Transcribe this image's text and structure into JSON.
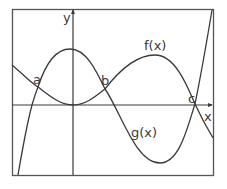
{
  "diagram": {
    "type": "function-graph",
    "axes": {
      "x_label": "x",
      "y_label": "y"
    },
    "curves": [
      {
        "name": "f",
        "label": "f(x)",
        "description": "cubic-like curve with local max near y-axis, local min, and second local max before rising sharply"
      },
      {
        "name": "g",
        "label": "g(x)",
        "description": "curve with minimum at origin, rising to intersection b, then dipping to deep minimum and rising to c"
      }
    ],
    "intersections": [
      {
        "label": "a"
      },
      {
        "label": "b"
      },
      {
        "label": "c"
      }
    ]
  },
  "colors": {
    "line": "#3a3a3a",
    "frame": "#555555",
    "background": "#ffffff"
  }
}
